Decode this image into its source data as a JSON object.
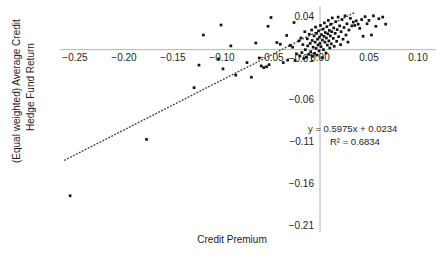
{
  "chart_data": {
    "type": "scatter",
    "title": "",
    "xlabel": "Credit Premium",
    "ylabel": "(Equal weighted) Average Credit Hedge Fund Return",
    "ylabel_line1": "(Equal weighted) Average Credit",
    "ylabel_line2": "Hedge Fund Return",
    "xlim": [
      -0.275,
      0.115
    ],
    "ylim": [
      -0.225,
      0.055
    ],
    "xticks": [
      -0.25,
      -0.2,
      -0.15,
      -0.1,
      -0.05,
      0.0,
      0.05,
      0.1
    ],
    "xtick_labels": [
      "-0.25",
      "-0.20",
      "-0.15",
      "-0.10",
      "-0.05",
      "0.00",
      "0.05",
      "0.10"
    ],
    "yticks": [
      0.04,
      -0.01,
      -0.06,
      -0.11,
      -0.16,
      -0.21
    ],
    "ytick_labels": [
      "0.04",
      "-0.01",
      "-0.06",
      "-0.11",
      "-0.16",
      "-0.21"
    ],
    "grid": false,
    "legend": false,
    "marker_color": "#121212",
    "trendline_color": "#3b3b3b",
    "axis_color": "#b4b4b4",
    "annotations": [
      {
        "name": "regression-equation",
        "text": "y = 0.5975x + 0.0234"
      },
      {
        "name": "r-squared",
        "text": "R² = 0.6834"
      }
    ],
    "regression": {
      "slope": 0.5975,
      "intercept": 0.0234,
      "r2": 0.6834,
      "style": "dotted"
    },
    "trendline_x_range": [
      -0.2605,
      0.0345
    ],
    "points": [
      [
        -0.255,
        -0.175
      ],
      [
        -0.177,
        -0.1075
      ],
      [
        -0.1285,
        -0.0455
      ],
      [
        -0.1235,
        -0.0185
      ],
      [
        -0.119,
        0.0175
      ],
      [
        -0.1035,
        -0.011
      ],
      [
        -0.101,
        0.0295
      ],
      [
        -0.099,
        -0.023
      ],
      [
        -0.091,
        0.0045
      ],
      [
        -0.086,
        -0.0305
      ],
      [
        -0.0745,
        -0.0155
      ],
      [
        -0.07,
        -0.033
      ],
      [
        -0.0655,
        0.008
      ],
      [
        -0.062,
        -0.01
      ],
      [
        -0.06,
        -0.0195
      ],
      [
        -0.0575,
        -0.0215
      ],
      [
        -0.0545,
        -0.0205
      ],
      [
        -0.053,
        0.028
      ],
      [
        -0.052,
        -0.018
      ],
      [
        -0.05,
        0.0385
      ],
      [
        -0.044,
        0.0085
      ],
      [
        -0.0405,
        0.0065
      ],
      [
        -0.0375,
        -0.0155
      ],
      [
        -0.034,
        0.017
      ],
      [
        -0.033,
        -0.0125
      ],
      [
        -0.0305,
        0.005
      ],
      [
        -0.028,
        0.003
      ],
      [
        -0.0265,
        0.0325
      ],
      [
        -0.0255,
        -0.013
      ],
      [
        -0.024,
        -0.005
      ],
      [
        -0.0215,
        0.0105
      ],
      [
        -0.0205,
        -0.0075
      ],
      [
        -0.0195,
        0.014
      ],
      [
        -0.0185,
        -0.0035
      ],
      [
        -0.0175,
        0.006
      ],
      [
        -0.0165,
        -0.0105
      ],
      [
        -0.0155,
        0.0215
      ],
      [
        -0.015,
        0.0
      ],
      [
        -0.014,
        -0.009
      ],
      [
        -0.013,
        0.013
      ],
      [
        -0.0125,
        0.0045
      ],
      [
        -0.0115,
        -0.0055
      ],
      [
        -0.011,
        0.0185
      ],
      [
        -0.01,
        0.0075
      ],
      [
        -0.0095,
        -0.0025
      ],
      [
        -0.0085,
        0.0235
      ],
      [
        -0.008,
        0.011
      ],
      [
        -0.0075,
        -0.008
      ],
      [
        -0.007,
        0.003
      ],
      [
        -0.006,
        0.0165
      ],
      [
        -0.0055,
        -0.0045
      ],
      [
        -0.005,
        0.009
      ],
      [
        -0.0045,
        0.027
      ],
      [
        -0.004,
        0.0015
      ],
      [
        -0.0035,
        0.0195
      ],
      [
        -0.003,
        -0.0065
      ],
      [
        -0.0025,
        0.0125
      ],
      [
        -0.002,
        0.0055
      ],
      [
        -0.0015,
        0.0225
      ],
      [
        -0.001,
        -0.0015
      ],
      [
        -0.0005,
        0.015
      ],
      [
        0.0,
        0.0075
      ],
      [
        0.0005,
        0.029
      ],
      [
        0.001,
        0.0035
      ],
      [
        0.0015,
        0.018
      ],
      [
        0.002,
        -0.0095
      ],
      [
        0.0025,
        0.0115
      ],
      [
        0.003,
        0.0245
      ],
      [
        0.0035,
        0.0
      ],
      [
        0.004,
        0.016
      ],
      [
        0.0045,
        0.032
      ],
      [
        0.005,
        0.009
      ],
      [
        0.0055,
        0.0205
      ],
      [
        0.006,
        -0.004
      ],
      [
        0.0065,
        0.014
      ],
      [
        0.007,
        0.0275
      ],
      [
        0.0075,
        0.0055
      ],
      [
        0.008,
        0.019
      ],
      [
        0.0085,
        0.035
      ],
      [
        0.009,
        0.0105
      ],
      [
        0.0095,
        0.023
      ],
      [
        0.01,
        0.002
      ],
      [
        0.0105,
        0.0165
      ],
      [
        0.011,
        0.0305
      ],
      [
        0.0115,
        0.007
      ],
      [
        0.012,
        0.0215
      ],
      [
        0.0125,
        0.038
      ],
      [
        0.0135,
        0.0135
      ],
      [
        0.014,
        0.026
      ],
      [
        0.0145,
        0.004
      ],
      [
        0.0155,
        0.0195
      ],
      [
        0.016,
        0.0335
      ],
      [
        0.017,
        0.01
      ],
      [
        0.0175,
        0.024
      ],
      [
        0.0185,
        0.039
      ],
      [
        0.019,
        0.0155
      ],
      [
        0.02,
        0.0285
      ],
      [
        0.021,
        0.006
      ],
      [
        0.0215,
        0.0215
      ],
      [
        0.0225,
        0.036
      ],
      [
        0.0235,
        0.0125
      ],
      [
        0.0245,
        0.0265
      ],
      [
        0.0255,
        0.0405
      ],
      [
        0.0265,
        0.0175
      ],
      [
        0.0275,
        0.031
      ],
      [
        0.0285,
        0.009
      ],
      [
        0.0295,
        0.0235
      ],
      [
        0.031,
        0.0375
      ],
      [
        0.0325,
        0.0285
      ],
      [
        0.034,
        0.033
      ],
      [
        0.0355,
        0.029
      ],
      [
        0.037,
        0.0345
      ],
      [
        0.039,
        0.0305
      ],
      [
        0.0405,
        0.0255
      ],
      [
        0.0425,
        0.036
      ],
      [
        0.044,
        0.016
      ],
      [
        0.046,
        0.0395
      ],
      [
        0.048,
        0.031
      ],
      [
        0.05,
        0.035
      ],
      [
        0.0525,
        0.0175
      ],
      [
        0.0545,
        0.0405
      ],
      [
        0.057,
        0.028
      ],
      [
        0.06,
        0.037
      ],
      [
        0.064,
        0.039
      ],
      [
        0.067,
        0.0305
      ]
    ]
  }
}
